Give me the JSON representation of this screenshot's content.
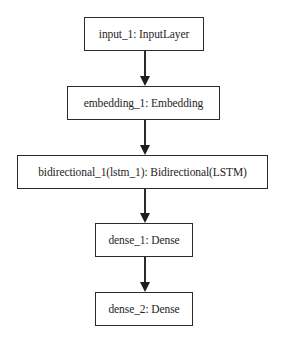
{
  "diagram": {
    "type": "keras-model-plot",
    "direction": "top-to-bottom",
    "nodes": [
      {
        "id": "input_1",
        "label": "input_1: InputLayer"
      },
      {
        "id": "embedding_1",
        "label": "embedding_1: Embedding"
      },
      {
        "id": "bidirectional_1",
        "label": "bidirectional_1(lstm_1): Bidirectional(LSTM)"
      },
      {
        "id": "dense_1",
        "label": "dense_1: Dense"
      },
      {
        "id": "dense_2",
        "label": "dense_2: Dense"
      }
    ],
    "edges": [
      {
        "from": "input_1",
        "to": "embedding_1"
      },
      {
        "from": "embedding_1",
        "to": "bidirectional_1"
      },
      {
        "from": "bidirectional_1",
        "to": "dense_1"
      },
      {
        "from": "dense_1",
        "to": "dense_2"
      }
    ],
    "colors": {
      "stroke": "#2b2b2b",
      "text": "#1e1e1e",
      "background": "#ffffff"
    }
  }
}
